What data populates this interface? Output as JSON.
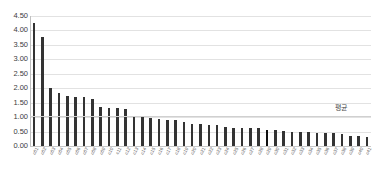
{
  "chart_data": {
    "type": "bar",
    "title": "",
    "xlabel": "",
    "ylabel": "",
    "ylim": [
      0.0,
      4.5
    ],
    "ytick_step": 0.5,
    "ytick_labels": [
      "0.00",
      "0.50",
      "1.00",
      "1.50",
      "2.00",
      "2.50",
      "3.00",
      "3.50",
      "4.00",
      "4.50"
    ],
    "ytick_values": [
      0.0,
      0.5,
      1.0,
      1.5,
      2.0,
      2.5,
      3.0,
      3.5,
      4.0,
      4.5
    ],
    "grid": true,
    "legend": "none",
    "sorted": "descending",
    "bar_color": "#333333",
    "highlight_color": "#101010",
    "highlight_index": 28,
    "categories": [
      "c01",
      "c02",
      "c03",
      "c04",
      "c05",
      "c06",
      "c07",
      "c08",
      "c09",
      "c10",
      "c11",
      "c12",
      "c13",
      "c14",
      "c15",
      "c16",
      "c17",
      "c18",
      "c19",
      "c20",
      "c21",
      "c22",
      "c23",
      "c24",
      "c25",
      "c26",
      "c27",
      "c28",
      "c29",
      "c30",
      "c31",
      "c32",
      "c33",
      "c34",
      "c35",
      "c36",
      "c37",
      "c38",
      "c39",
      "c40",
      "c41"
    ],
    "values": [
      4.25,
      3.78,
      2.02,
      1.83,
      1.72,
      1.7,
      1.68,
      1.62,
      1.36,
      1.3,
      1.31,
      1.28,
      1.02,
      1.0,
      0.97,
      0.92,
      0.9,
      0.89,
      0.82,
      0.77,
      0.75,
      0.74,
      0.73,
      0.66,
      0.63,
      0.62,
      0.62,
      0.61,
      0.57,
      0.55,
      0.52,
      0.5,
      0.48,
      0.47,
      0.46,
      0.45,
      0.44,
      0.42,
      0.35,
      0.34,
      0.32
    ],
    "reference_line": {
      "label": "평균",
      "value": 1.05,
      "color": "#d0d0d0"
    }
  }
}
